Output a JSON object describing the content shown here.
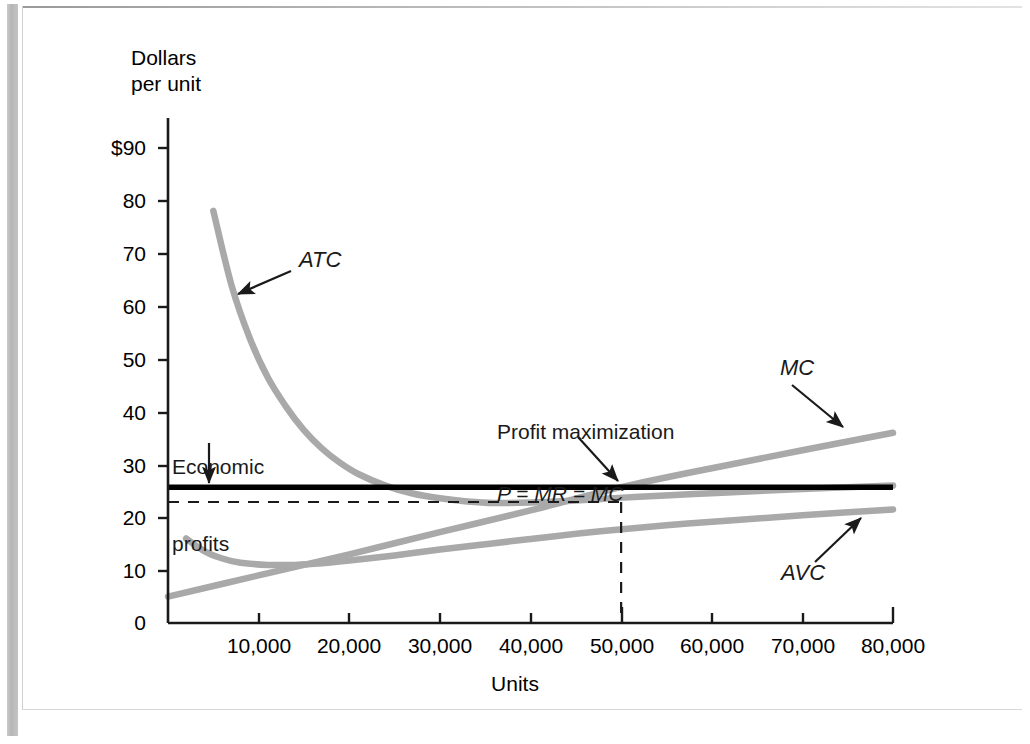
{
  "figure": {
    "y_axis_title_line1": "Dollars",
    "y_axis_title_line2": "per unit",
    "x_axis_title": "Units"
  },
  "annotations": {
    "atc_label": "ATC",
    "mc_label": "MC",
    "avc_label": "AVC",
    "economic_profits_line1": "Economic",
    "economic_profits_line2": "profits",
    "profit_max_line1": "Profit maximization",
    "profit_max_line2": "P = MR = MC"
  },
  "colors": {
    "curve": "#a9a9a9",
    "axis": "#1a1a1a",
    "mr_line": "#000000",
    "text": "#1a1a1a"
  },
  "chart_data": {
    "type": "line",
    "title": "",
    "xlabel": "Units",
    "ylabel": "Dollars per unit",
    "xlim": [
      0,
      80000
    ],
    "ylim": [
      0,
      95
    ],
    "grid": false,
    "legend": "inline-annotations",
    "x_ticks": [
      0,
      10000,
      20000,
      30000,
      40000,
      50000,
      60000,
      70000,
      80000
    ],
    "x_tick_labels": [
      "0",
      "10,000",
      "20,000",
      "30,000",
      "40,000",
      "50,000",
      "60,000",
      "70,000",
      "80,000"
    ],
    "y_ticks": [
      0,
      10,
      20,
      30,
      40,
      50,
      60,
      70,
      80,
      90
    ],
    "y_tick_labels": [
      "0",
      "10",
      "20",
      "30",
      "40",
      "50",
      "60",
      "70",
      "80",
      "$90"
    ],
    "series": [
      {
        "name": "ATC",
        "label": "ATC",
        "style": "solid-gray-thick",
        "points": [
          [
            5000,
            78
          ],
          [
            7000,
            64
          ],
          [
            9000,
            54
          ],
          [
            11000,
            46.5
          ],
          [
            13000,
            41
          ],
          [
            15000,
            36.5
          ],
          [
            17000,
            33
          ],
          [
            19000,
            30.3
          ],
          [
            21000,
            28.2
          ],
          [
            24000,
            26
          ],
          [
            27000,
            24.5
          ],
          [
            30000,
            23.6
          ],
          [
            33000,
            23.0
          ],
          [
            36000,
            22.7
          ],
          [
            40000,
            22.8
          ],
          [
            44000,
            23.1
          ],
          [
            48000,
            23.5
          ],
          [
            52000,
            23.9
          ],
          [
            58000,
            24.4
          ],
          [
            64000,
            24.9
          ],
          [
            72000,
            25.5
          ],
          [
            80000,
            26.0
          ]
        ]
      },
      {
        "name": "AVC",
        "label": "AVC",
        "style": "solid-gray-thick",
        "points": [
          [
            2000,
            16
          ],
          [
            4000,
            13.6
          ],
          [
            6000,
            12.2
          ],
          [
            8000,
            11.4
          ],
          [
            11000,
            11.0
          ],
          [
            14000,
            11.0
          ],
          [
            17000,
            11.3
          ],
          [
            20000,
            11.8
          ],
          [
            25000,
            12.8
          ],
          [
            30000,
            13.9
          ],
          [
            36000,
            15.1
          ],
          [
            42000,
            16.3
          ],
          [
            48000,
            17.4
          ],
          [
            55000,
            18.5
          ],
          [
            62000,
            19.4
          ],
          [
            70000,
            20.4
          ],
          [
            80000,
            21.5
          ]
        ]
      },
      {
        "name": "MC",
        "label": "MC",
        "style": "solid-gray-thick",
        "points": [
          [
            0,
            5
          ],
          [
            10000,
            9.0
          ],
          [
            20000,
            13.0
          ],
          [
            30000,
            17.2
          ],
          [
            40000,
            21.3
          ],
          [
            50000,
            25.7
          ],
          [
            60000,
            29.3
          ],
          [
            70000,
            32.7
          ],
          [
            80000,
            36.0
          ]
        ]
      },
      {
        "name": "P = MR",
        "label": "P = MR = MC",
        "style": "solid-black-thick-horizontal",
        "points": [
          [
            0,
            25.7
          ],
          [
            80000,
            25.7
          ]
        ]
      }
    ],
    "reference_lines": [
      {
        "name": "atc-at-profit-max",
        "orientation": "horizontal",
        "value": 22.9,
        "style": "dashed",
        "from_x": 0,
        "to_x": 50000
      },
      {
        "name": "profit-max-quantity",
        "orientation": "vertical",
        "value": 50000,
        "style": "dashed",
        "from_y": 0,
        "to_y": 22.9
      }
    ],
    "annotations": [
      {
        "text": "ATC",
        "italic": true,
        "points_to": [
          10500,
          47
        ]
      },
      {
        "text": "MC",
        "italic": true,
        "points_to": [
          72000,
          33.5
        ]
      },
      {
        "text": "AVC",
        "italic": true,
        "points_to": [
          76500,
          21.3
        ]
      },
      {
        "text": "Economic profits",
        "italic": false,
        "points_to": [
          7000,
          25.7
        ]
      },
      {
        "text": "Profit maximization / P = MR = MC",
        "italic": "second-line",
        "points_to": [
          50000,
          25.7
        ]
      }
    ]
  }
}
